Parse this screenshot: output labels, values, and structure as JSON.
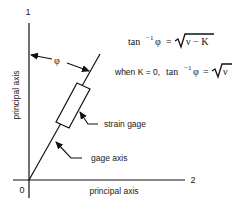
{
  "diagram": {
    "axis_vertical_number": "1",
    "axis_horizontal_number": "2",
    "origin_label": "0",
    "vertical_axis_label": "principal axis",
    "horizontal_axis_label": "principal axis",
    "angle_symbol": "φ",
    "strain_gage_label": "strain gage",
    "gage_axis_label": "gage axis",
    "equation_1": {
      "lhs_func": "tan",
      "lhs_exp": "−1",
      "lhs_var": "φ",
      "equals": "=",
      "radicand": "ν − K"
    },
    "equation_2": {
      "prefix": "when K = 0,",
      "lhs_func": "tan",
      "lhs_exp": "−1",
      "lhs_var": "φ",
      "equals": "=",
      "radicand": "ν"
    },
    "colors": {
      "line": "#111111",
      "background": "#ffffff"
    }
  }
}
